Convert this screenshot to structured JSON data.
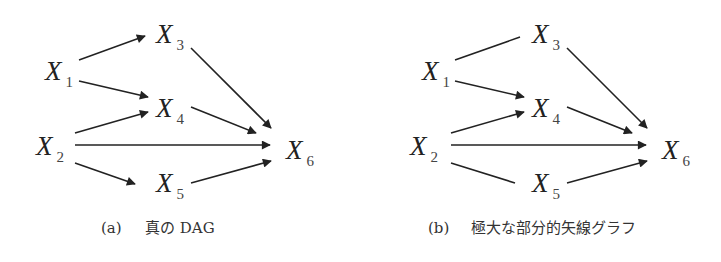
{
  "figure": {
    "panels": [
      {
        "id": "a",
        "caption_label": "(a)",
        "caption_text": "真の DAG",
        "nodes": [
          {
            "id": "X1",
            "main": "X",
            "sub": "1",
            "x": 45,
            "y": 80
          },
          {
            "id": "X2",
            "main": "X",
            "sub": "2",
            "x": 36,
            "y": 155
          },
          {
            "id": "X3",
            "main": "X",
            "sub": "3",
            "x": 156,
            "y": 43
          },
          {
            "id": "X4",
            "main": "X",
            "sub": "4",
            "x": 156,
            "y": 117
          },
          {
            "id": "X5",
            "main": "X",
            "sub": "5",
            "x": 156,
            "y": 192
          },
          {
            "id": "X6",
            "main": "X",
            "sub": "6",
            "x": 286,
            "y": 159
          }
        ],
        "edges": [
          {
            "from": "X1",
            "to": "X3",
            "directed": true,
            "x1": 79,
            "y1": 60,
            "x2": 145,
            "y2": 36
          },
          {
            "from": "X1",
            "to": "X4",
            "directed": true,
            "x1": 79,
            "y1": 81,
            "x2": 148,
            "y2": 97
          },
          {
            "from": "X2",
            "to": "X4",
            "directed": true,
            "x1": 75,
            "y1": 133,
            "x2": 148,
            "y2": 112
          },
          {
            "from": "X2",
            "to": "X6",
            "directed": true,
            "x1": 75,
            "y1": 145,
            "x2": 270,
            "y2": 145
          },
          {
            "from": "X2",
            "to": "X5",
            "directed": true,
            "x1": 75,
            "y1": 163,
            "x2": 135,
            "y2": 184
          },
          {
            "from": "X3",
            "to": "X6",
            "directed": true,
            "x1": 191,
            "y1": 48,
            "x2": 271,
            "y2": 128
          },
          {
            "from": "X4",
            "to": "X6",
            "directed": true,
            "x1": 191,
            "y1": 107,
            "x2": 256,
            "y2": 133
          },
          {
            "from": "X5",
            "to": "X6",
            "directed": true,
            "x1": 191,
            "y1": 183,
            "x2": 271,
            "y2": 161
          }
        ]
      },
      {
        "id": "b",
        "caption_label": "(b)",
        "caption_text": "極大な部分的矢線グラフ",
        "nodes": [
          {
            "id": "X1",
            "main": "X",
            "sub": "1",
            "x": 422,
            "y": 80
          },
          {
            "id": "X2",
            "main": "X",
            "sub": "2",
            "x": 410,
            "y": 155
          },
          {
            "id": "X3",
            "main": "X",
            "sub": "3",
            "x": 532,
            "y": 43
          },
          {
            "id": "X4",
            "main": "X",
            "sub": "4",
            "x": 532,
            "y": 117
          },
          {
            "id": "X5",
            "main": "X",
            "sub": "5",
            "x": 532,
            "y": 192
          },
          {
            "id": "X6",
            "main": "X",
            "sub": "6",
            "x": 662,
            "y": 159
          }
        ],
        "edges": [
          {
            "from": "X1",
            "to": "X3",
            "directed": false,
            "x1": 455,
            "y1": 60,
            "x2": 520,
            "y2": 37
          },
          {
            "from": "X1",
            "to": "X4",
            "directed": true,
            "x1": 455,
            "y1": 81,
            "x2": 524,
            "y2": 97
          },
          {
            "from": "X2",
            "to": "X4",
            "directed": true,
            "x1": 451,
            "y1": 133,
            "x2": 524,
            "y2": 112
          },
          {
            "from": "X2",
            "to": "X6",
            "directed": true,
            "x1": 451,
            "y1": 145,
            "x2": 646,
            "y2": 145
          },
          {
            "from": "X2",
            "to": "X5",
            "directed": false,
            "x1": 451,
            "y1": 163,
            "x2": 515,
            "y2": 183
          },
          {
            "from": "X3",
            "to": "X6",
            "directed": true,
            "x1": 567,
            "y1": 48,
            "x2": 647,
            "y2": 128
          },
          {
            "from": "X4",
            "to": "X6",
            "directed": true,
            "x1": 567,
            "y1": 107,
            "x2": 632,
            "y2": 133
          },
          {
            "from": "X5",
            "to": "X6",
            "directed": true,
            "x1": 567,
            "y1": 183,
            "x2": 647,
            "y2": 161
          }
        ]
      }
    ]
  }
}
